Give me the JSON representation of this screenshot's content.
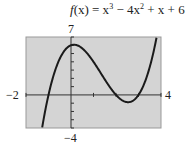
{
  "chart_data": {
    "type": "line",
    "function": "x^3 - 4x^2 + x + 6",
    "xlabel": "",
    "ylabel": "",
    "xlim": [
      -2,
      4
    ],
    "ylim": [
      -4,
      7
    ],
    "x_tick_step": 1,
    "y_tick_step": 1,
    "grid": false,
    "window_labels": {
      "xmin": "−2",
      "xmax": "4",
      "ymin": "−4",
      "ymax": "7"
    },
    "x": [
      -1.4,
      -1.2,
      -1,
      -0.8,
      -0.6,
      -0.4,
      -0.2,
      0,
      0.2,
      0.4,
      0.6,
      0.8,
      1,
      1.2,
      1.4,
      1.6,
      1.8,
      2,
      2.2,
      2.4,
      2.6,
      2.8,
      3,
      3.2,
      3.4,
      3.6,
      3.8
    ],
    "y": [
      -4.98,
      -1.68,
      0,
      1.73,
      3.02,
      5.09,
      5.83,
      6,
      5.65,
      5.82,
      5.22,
      4.75,
      4,
      3.17,
      2.3,
      1.46,
      0.68,
      0,
      -0.52,
      -0.86,
      -0.98,
      -0.88,
      0,
      0.97,
      2.46,
      4.57,
      7.35
    ],
    "roots": [
      -1,
      2,
      3
    ],
    "local_max": {
      "x": 0.13,
      "y": 6.06
    },
    "local_min": {
      "x": 2.54,
      "y": -0.88
    },
    "background_color": "#d4d4d4",
    "curve_color": "#1a1a1a"
  },
  "labels": {
    "fx": "f",
    "x_paren": "(x) = x",
    "exp3": "3",
    "minus4x": " − 4x",
    "exp2": "2",
    "tail": " + x + 6",
    "ymax": "7",
    "ymin": "−4",
    "xmin": "−2",
    "xmax": "4"
  }
}
